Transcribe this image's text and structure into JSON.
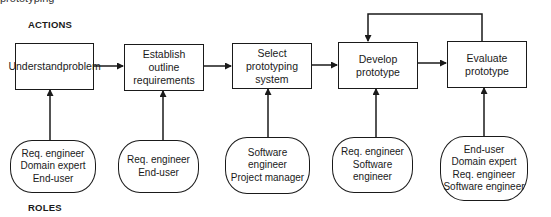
{
  "header_fragment": "prototyping",
  "labels": {
    "actions": "ACTIONS",
    "roles": "ROLES"
  },
  "actions": [
    {
      "lines": [
        "Understand",
        "problem"
      ]
    },
    {
      "lines": [
        "Establish",
        "outline",
        "requirements"
      ]
    },
    {
      "lines": [
        "Select",
        "prototyping",
        "system"
      ]
    },
    {
      "lines": [
        "Develop",
        "prototype"
      ]
    },
    {
      "lines": [
        "Evaluate",
        "prototype"
      ]
    }
  ],
  "roles": [
    {
      "lines": [
        "Req. engineer",
        "Domain expert",
        "End-user"
      ]
    },
    {
      "lines": [
        "Req. engineer",
        "End-user"
      ]
    },
    {
      "lines": [
        "Software",
        "engineer",
        "Project manager"
      ]
    },
    {
      "lines": [
        "Req. engineer",
        "Software",
        "engineer"
      ]
    },
    {
      "lines": [
        "End-user",
        "Domain expert",
        "Req. engineer",
        "Software engineer"
      ]
    }
  ],
  "connections": {
    "sequence": [
      "Understand problem → Establish outline requirements",
      "Establish outline requirements → Select prototyping system",
      "Select prototyping system → Develop prototype",
      "Develop prototype → Evaluate prototype"
    ],
    "feedback": "Evaluate prototype → Develop prototype",
    "role_links": "each role group → action above"
  }
}
